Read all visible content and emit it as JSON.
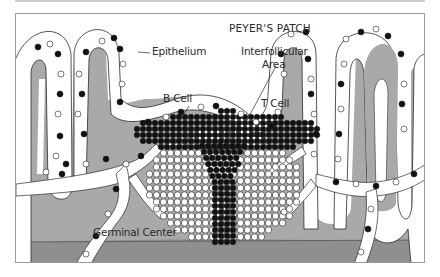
{
  "diagram": {
    "title": "PEYER'S PATCH",
    "labels": {
      "epithelium": "Epithelium",
      "interfollicular_line1": "Interfollicular",
      "interfollicular_line2": "Area",
      "b_cell": "B Cell",
      "t_cell": "T Cell",
      "germinal_center": "Germinal Center"
    },
    "legend_semantics": {
      "filled_circle": "T Cell",
      "open_circle": "B Cell"
    },
    "colors": {
      "background": "#ffffff",
      "lamina": "#a9a9a9",
      "dark_band": "#8f8f8f",
      "epithelium_fill": "#ffffff",
      "cell_dark": "#111111",
      "outline": "#2a2a2a"
    }
  }
}
